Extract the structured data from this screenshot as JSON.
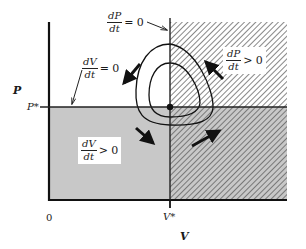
{
  "diagram": {
    "type": "phase-plane",
    "axes": {
      "x_label": "V",
      "y_label": "P",
      "origin_label": "0",
      "x_equilibrium_label": "V*",
      "y_equilibrium_label": "P*"
    },
    "nullclines": [
      {
        "id": "dPdt-zero",
        "numerator": "dP",
        "denominator": "dt",
        "relation": "= 0",
        "orientation": "vertical at V*"
      },
      {
        "id": "dVdt-zero",
        "numerator": "dV",
        "denominator": "dt",
        "relation": "= 0",
        "orientation": "horizontal at P*"
      }
    ],
    "regions": [
      {
        "id": "dPdt-positive",
        "numerator": "dP",
        "denominator": "dt",
        "relation": "> 0",
        "fill": "hatched",
        "extent": "V > V*"
      },
      {
        "id": "dVdt-positive",
        "numerator": "dV",
        "denominator": "dt",
        "relation": "> 0",
        "fill": "gray",
        "extent": "P < P*"
      }
    ],
    "equilibrium": {
      "label": "(V*, P*)"
    },
    "orbits": {
      "count": 2,
      "direction": "counterclockwise"
    },
    "arrows": [
      {
        "quadrant": "upper-left",
        "direction": "down-left"
      },
      {
        "quadrant": "lower-left",
        "direction": "down-right"
      },
      {
        "quadrant": "lower-right",
        "direction": "up-right"
      },
      {
        "quadrant": "upper-right",
        "direction": "up-left"
      }
    ],
    "colors": {
      "ink": "#1a1a1a",
      "gray_fill": "#c8c8c8",
      "hatch": "#555555",
      "background": "#ffffff"
    }
  }
}
